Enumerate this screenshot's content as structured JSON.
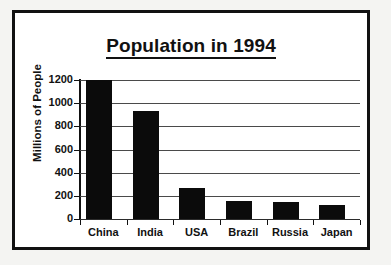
{
  "chart_data": {
    "type": "bar",
    "title": "Population in 1994",
    "xlabel": "",
    "ylabel": "Millions of People",
    "categories": [
      "China",
      "India",
      "USA",
      "Brazil",
      "Russia",
      "Japan"
    ],
    "values": [
      1200,
      930,
      265,
      155,
      145,
      120
    ],
    "ylim": [
      0,
      1200
    ],
    "ytick_labels": [
      "1200",
      "1000",
      "800",
      "600",
      "400",
      "200",
      "0"
    ],
    "ytick_values": [
      1200,
      1000,
      800,
      600,
      400,
      200,
      0
    ],
    "grid": true,
    "legend": false,
    "bar_color": "#0b0b0b",
    "gridline_color": "#4a4a4a",
    "frame_color": "#111111",
    "background_color": "#ffffff"
  }
}
